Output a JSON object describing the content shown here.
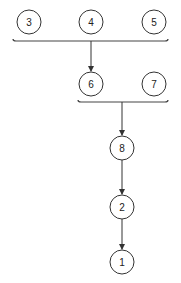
{
  "diagram": {
    "type": "tree-merge",
    "nodes": [
      {
        "id": "n3",
        "label": "3",
        "cx": 29,
        "cy": 22
      },
      {
        "id": "n4",
        "label": "4",
        "cx": 91,
        "cy": 22
      },
      {
        "id": "n5",
        "label": "5",
        "cx": 154,
        "cy": 22
      },
      {
        "id": "n6",
        "label": "6",
        "cx": 91,
        "cy": 84
      },
      {
        "id": "n7",
        "label": "7",
        "cx": 154,
        "cy": 84
      },
      {
        "id": "n8",
        "label": "8",
        "cx": 122,
        "cy": 148
      },
      {
        "id": "n2",
        "label": "2",
        "cx": 122,
        "cy": 207
      },
      {
        "id": "n1",
        "label": "1",
        "cx": 122,
        "cy": 262
      }
    ],
    "groups": [
      {
        "id": "g1",
        "members": [
          "3",
          "4",
          "5"
        ],
        "target": "6"
      },
      {
        "id": "g2",
        "members": [
          "6",
          "7"
        ],
        "target": "8"
      }
    ],
    "edges": [
      {
        "from": "group(3,4,5)",
        "to": "6"
      },
      {
        "from": "group(6,7)",
        "to": "8"
      },
      {
        "from": "8",
        "to": "2"
      },
      {
        "from": "2",
        "to": "1"
      }
    ],
    "colors": {
      "stroke": "#333333",
      "background": "#ffffff"
    }
  }
}
